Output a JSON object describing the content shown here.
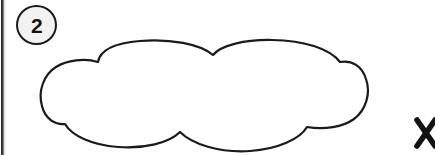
{
  "page": {
    "width": 435,
    "height": 155,
    "background_color": "#fefefe",
    "ink_color": "#1a1a1a"
  },
  "step_badge": {
    "label": "2",
    "shape": "circle",
    "fill_color": "#f2f2f2",
    "border_color": "#1a1a1a",
    "icon_name": "circled-number-badge"
  },
  "cloud": {
    "label": "",
    "icon_name": "cloud-outline-shape",
    "stroke_color": "#1a1a1a",
    "fill_color": "#ffffff",
    "stroke_width": 2.2,
    "lobe_count": 7,
    "bounds": {
      "left": 42,
      "top": 41,
      "right": 369,
      "bottom": 152
    }
  },
  "x_mark": {
    "label": "×",
    "icon_name": "x-mark-cross-icon",
    "stroke_color": "#121212",
    "cropped": "true",
    "position": {
      "x": 424,
      "y": 133
    }
  },
  "gutter": {
    "label": "",
    "icon_name": "page-gutter-scan-artifact",
    "color": "#2a2a2a"
  }
}
